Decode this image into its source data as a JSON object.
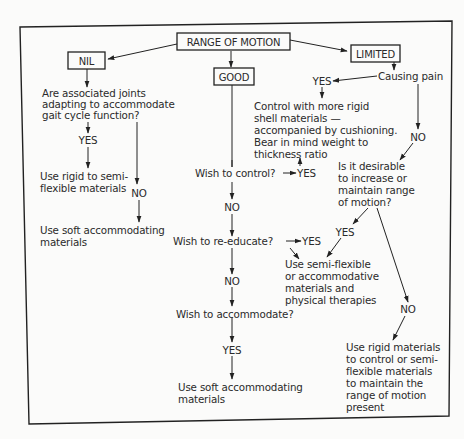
{
  "diagram": {
    "root": "RANGE OF MOTION",
    "branches": {
      "nil": {
        "label": "NIL",
        "question": [
          "Are associated joints",
          "adapting to accommodate",
          "gait cycle function?"
        ],
        "yes_label": "YES",
        "yes_result": [
          "Use rigid to semi-",
          "flexible materials"
        ],
        "no_label": "NO",
        "no_result": [
          "Use soft accommodating",
          "materials"
        ]
      },
      "good": {
        "label": "GOOD",
        "q1": "Wish to control?",
        "q1_yes": "YES",
        "q1_no": "NO",
        "q2": "Wish to re-educate?",
        "q2_yes": "YES",
        "q2_no": "NO",
        "q3": "Wish to accommodate?",
        "q3_yes": "YES",
        "q3_result": [
          "Use soft accommodating",
          "materials"
        ]
      },
      "limited": {
        "label": "LIMITED",
        "question": "Causing pain",
        "yes_label": "YES",
        "yes_result": [
          "Control with more rigid",
          "shell materials —",
          "accompanied by cushioning.",
          "Bear in mind weight to",
          "thickness ratio"
        ],
        "no_label": "NO",
        "q2": [
          "Is it desirable",
          "to increase or",
          "maintain range",
          "of motion?"
        ],
        "q2_yes": "YES",
        "shared_result": [
          "Use semi-flexible",
          "or accommodative",
          "materials and",
          "physical therapies"
        ],
        "q2_no": "NO",
        "no_result": [
          "Use rigid materials",
          "to control or semi-",
          "flexible materials",
          "to maintain the",
          "range of motion",
          "present"
        ]
      }
    }
  }
}
